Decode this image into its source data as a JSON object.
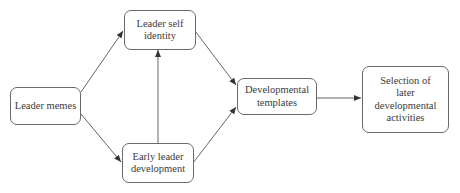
{
  "diagram": {
    "type": "flowchart",
    "nodes": {
      "leader_memes": {
        "label": "Leader memes"
      },
      "leader_self_identity": {
        "label": "Leader self identity"
      },
      "early_leader_development": {
        "label": "Early leader development"
      },
      "developmental_templates": {
        "label": "Developmental templates"
      },
      "selection_later_activities": {
        "label": "Selection of later developmental activities"
      }
    },
    "edges": [
      {
        "from": "Leader memes",
        "to": "Leader self identity"
      },
      {
        "from": "Leader memes",
        "to": "Early leader development"
      },
      {
        "from": "Early leader development",
        "to": "Leader self identity"
      },
      {
        "from": "Leader self identity",
        "to": "Developmental templates"
      },
      {
        "from": "Early leader development",
        "to": "Developmental templates"
      },
      {
        "from": "Developmental templates",
        "to": "Selection of later developmental activities"
      }
    ],
    "colors": {
      "line": "#555555",
      "border": "#6a6a6a",
      "text": "#3a3a3a",
      "background": "#ffffff"
    }
  }
}
